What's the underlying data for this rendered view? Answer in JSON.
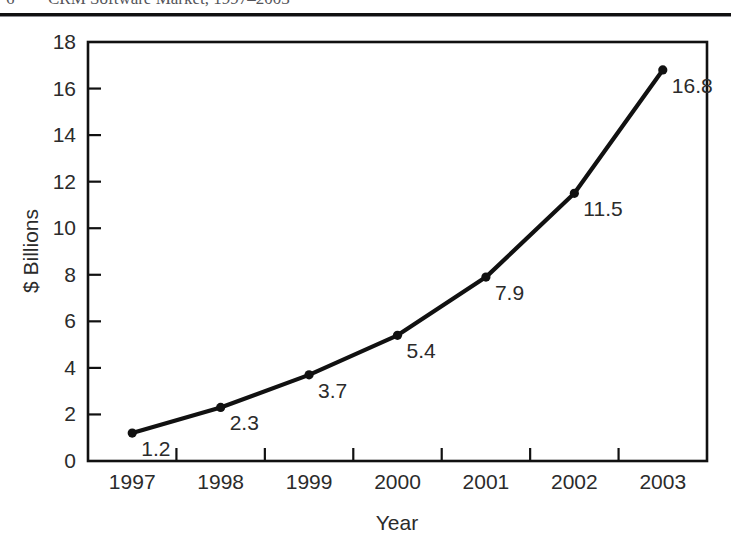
{
  "page_header": {
    "page_number": "6",
    "running_title": "CRM Software Market, 1997–2003"
  },
  "chart_data": {
    "type": "line",
    "title": "",
    "xlabel": "Year",
    "ylabel": "$ Billions",
    "categories": [
      "1997",
      "1998",
      "1999",
      "2000",
      "2001",
      "2002",
      "2003"
    ],
    "values": [
      1.2,
      2.3,
      3.7,
      5.4,
      7.9,
      11.5,
      16.8
    ],
    "point_labels": [
      "1.2",
      "2.3",
      "3.7",
      "5.4",
      "7.9",
      "11.5",
      "16.8"
    ],
    "ylim": [
      0,
      18
    ],
    "ytick_step": 2,
    "yticks": [
      0,
      2,
      4,
      6,
      8,
      10,
      12,
      14,
      16,
      18
    ],
    "ytick_labels": [
      "0",
      "2",
      "4",
      "6",
      "8",
      "10",
      "12",
      "14",
      "16",
      "18"
    ],
    "grid": false,
    "legend": false,
    "series_color": "#111111",
    "marker": "circle",
    "axis_color": "#111111",
    "background": "#ffffff"
  }
}
